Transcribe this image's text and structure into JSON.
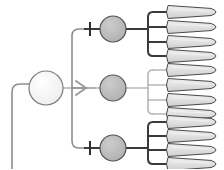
{
  "diagram": {
    "type": "neural-circuit-schematic",
    "title": "",
    "canvas": {
      "width": 224,
      "height": 169,
      "background": "#ffffff"
    },
    "colors": {
      "dark_connector": "#3a3a3a",
      "light_connector": "#b0b0b0",
      "mid_connector": "#8d8d8d",
      "soma_source_fill": "#f2f2f2",
      "soma_source_stroke": "#7d7d7d",
      "interneuron_fill": "#b8b8b8",
      "interneuron_stroke": "#5a5a5a",
      "muscle_fill": "#dcdcdc",
      "muscle_stroke": "#4a4a4a",
      "muscle_highlight": "#efefef"
    },
    "source_neuron": {
      "label": "",
      "cx": 46,
      "cy": 88,
      "r": 17,
      "fill": "#f2f2f2",
      "stroke": "#7d7d7d",
      "axon": {
        "label": "",
        "path": "M 12 169 L 12 92 Q 12 84 20 84 L 29 84",
        "stroke": "#8d8d8d",
        "width": 1.6
      },
      "output_segment": {
        "path": "M 63 88 L 88 88",
        "stroke": "#b0b0b0",
        "width": 1.6
      }
    },
    "trunk": {
      "label": "branch-trunk",
      "path": "M 95 88 L 72 88 L 72 36 Q 72 29 79 29 L 86 29 M 72 88 L 72 141 Q 72 148 79 148 L 86 148",
      "stroke": "#8d8d8d",
      "width": 1.6
    },
    "synapse_symbols": [
      {
        "kind": "inhibitory-tbar",
        "x": 86,
        "y": 29,
        "color": "#2f2f2f"
      },
      {
        "kind": "excitatory-arrow",
        "x": 78,
        "y": 88,
        "color": "#9a9a9a"
      },
      {
        "kind": "inhibitory-tbar",
        "x": 86,
        "y": 148,
        "color": "#2f2f2f"
      }
    ],
    "branches": [
      {
        "id": "branch-top",
        "label": "",
        "synapse": "inhibitory-tbar",
        "connector_color": "#3a3a3a",
        "connector_width": 2.0,
        "interneuron": {
          "cx": 113,
          "cy": 29,
          "r": 13,
          "fill": "#b8b8b8",
          "stroke": "#4f4f4f"
        },
        "axon_path": "M 126 29 L 148 29",
        "comb_spine": {
          "x": 148,
          "y_top": 12,
          "y_bottom": 56
        },
        "target_ys": [
          12,
          27,
          42,
          56
        ],
        "targets": [
          {
            "label": "",
            "cy": 12
          },
          {
            "label": "",
            "cy": 27
          },
          {
            "label": "",
            "cy": 42
          },
          {
            "label": "",
            "cy": 56
          }
        ]
      },
      {
        "id": "branch-middle",
        "label": "",
        "synapse": "excitatory-arrow",
        "connector_color": "#b6b6b6",
        "connector_width": 1.6,
        "interneuron": {
          "cx": 113,
          "cy": 88,
          "r": 13,
          "fill": "#b8b8b8",
          "stroke": "#5a5a5a"
        },
        "axon_path": "M 126 88 L 148 88",
        "comb_spine": {
          "x": 148,
          "y_top": 70,
          "y_bottom": 114
        },
        "target_ys": [
          70,
          85,
          100,
          114
        ],
        "targets": [
          {
            "label": "",
            "cy": 70
          },
          {
            "label": "",
            "cy": 85
          },
          {
            "label": "",
            "cy": 100
          },
          {
            "label": "",
            "cy": 114
          }
        ]
      },
      {
        "id": "branch-bottom",
        "label": "",
        "synapse": "inhibitory-tbar",
        "connector_color": "#3a3a3a",
        "connector_width": 2.0,
        "interneuron": {
          "cx": 113,
          "cy": 148,
          "r": 13,
          "fill": "#b8b8b8",
          "stroke": "#4f4f4f"
        },
        "axon_path": "M 126 148 L 148 148",
        "comb_spine": {
          "x": 148,
          "y_top": 122,
          "y_bottom": 164
        },
        "target_ys": [
          122,
          136,
          150,
          164
        ],
        "targets": [
          {
            "label": "",
            "cy": 122
          },
          {
            "label": "",
            "cy": 136
          },
          {
            "label": "",
            "cy": 150
          },
          {
            "label": "",
            "cy": 164
          }
        ]
      }
    ],
    "muscle_fibers": {
      "count": 12,
      "shape": "tapered-spindle",
      "x_left": 168,
      "x_right": 221,
      "half_height": 6.5,
      "items": [
        {
          "id": "fiber-1",
          "cy": 12,
          "group": "branch-top"
        },
        {
          "id": "fiber-2",
          "cy": 27,
          "group": "branch-top"
        },
        {
          "id": "fiber-3",
          "cy": 42,
          "group": "branch-top"
        },
        {
          "id": "fiber-4",
          "cy": 56,
          "group": "branch-top"
        },
        {
          "id": "fiber-5",
          "cy": 70,
          "group": "branch-middle"
        },
        {
          "id": "fiber-6",
          "cy": 85,
          "group": "branch-middle"
        },
        {
          "id": "fiber-7",
          "cy": 100,
          "group": "branch-middle"
        },
        {
          "id": "fiber-8",
          "cy": 114,
          "group": "branch-middle"
        },
        {
          "id": "fiber-9",
          "cy": 122,
          "group": "branch-bottom"
        },
        {
          "id": "fiber-10",
          "cy": 136,
          "group": "branch-bottom"
        },
        {
          "id": "fiber-11",
          "cy": 150,
          "group": "branch-bottom"
        },
        {
          "id": "fiber-12",
          "cy": 164,
          "group": "branch-bottom"
        }
      ]
    }
  }
}
